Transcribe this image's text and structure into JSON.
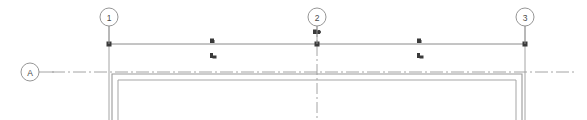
{
  "drawing": {
    "type": "architectural-floor-plan-fragment",
    "background_color": "#ffffff",
    "line_color": "#8a8a8a",
    "dark_line_color": "#6e6e6e",
    "marker_color": "#3a3a3a",
    "text_color": "#4a4a4a",
    "canvas": {
      "width": 587,
      "height": 120
    }
  },
  "grid_bubbles": [
    {
      "id": "grid-bubble-1",
      "label": "1",
      "cx": 109,
      "cy": 17,
      "r": 9,
      "axis": "vertical",
      "leader_from_y": 26,
      "leader_to_y": 44
    },
    {
      "id": "grid-bubble-2",
      "label": "2",
      "cx": 317,
      "cy": 17,
      "r": 9,
      "axis": "vertical",
      "leader_from_y": 26,
      "leader_to_y": 44
    },
    {
      "id": "grid-bubble-3",
      "label": "3",
      "cx": 525,
      "cy": 17,
      "r": 9,
      "axis": "vertical",
      "leader_from_y": 26,
      "leader_to_y": 44
    },
    {
      "id": "grid-bubble-A",
      "label": "A",
      "cx": 30,
      "cy": 72,
      "r": 9,
      "axis": "horizontal",
      "leader_from_x": 39,
      "leader_to_x": 52
    }
  ],
  "grid_lines": {
    "horizontal_top": {
      "name": "upper-grid-line",
      "x1": 108,
      "y1": 44,
      "x2": 526,
      "y2": 44
    },
    "horizontal_A": {
      "name": "grid-line-A",
      "x1": 52,
      "y1": 72,
      "x2": 575,
      "y2": 72,
      "style": "dash-dot"
    },
    "vertical_1": {
      "name": "grid-line-1",
      "x": 109,
      "y1": 26,
      "y2": 120,
      "style": "solid"
    },
    "vertical_2": {
      "name": "grid-line-2",
      "x": 317,
      "y1": 26,
      "y2": 120,
      "style": "dash-dot"
    },
    "vertical_3": {
      "name": "grid-line-3",
      "x": 525,
      "y1": 26,
      "y2": 120,
      "style": "solid"
    }
  },
  "walls": {
    "outer": {
      "name": "outer-wall-outline",
      "left": 112,
      "right": 522,
      "top": 74,
      "bottom": 120
    },
    "inner": {
      "name": "inner-wall-outline",
      "left": 118,
      "right": 516,
      "top": 80,
      "bottom": 120
    }
  },
  "intersection_nodes": [
    {
      "name": "grid-node-1",
      "x": 109,
      "y": 44
    },
    {
      "name": "grid-node-2",
      "x": 317,
      "y": 44
    },
    {
      "name": "grid-node-3",
      "x": 525,
      "y": 44
    }
  ],
  "annotation_markers": [
    {
      "name": "annotation-marker-left",
      "x": 213,
      "y": 44,
      "above_label": "",
      "below_label": ""
    },
    {
      "name": "annotation-marker-center",
      "x": 317,
      "y": 33,
      "above_label": "",
      "below_label": ""
    },
    {
      "name": "annotation-marker-right",
      "x": 420,
      "y": 44,
      "above_label": "",
      "below_label": ""
    }
  ]
}
